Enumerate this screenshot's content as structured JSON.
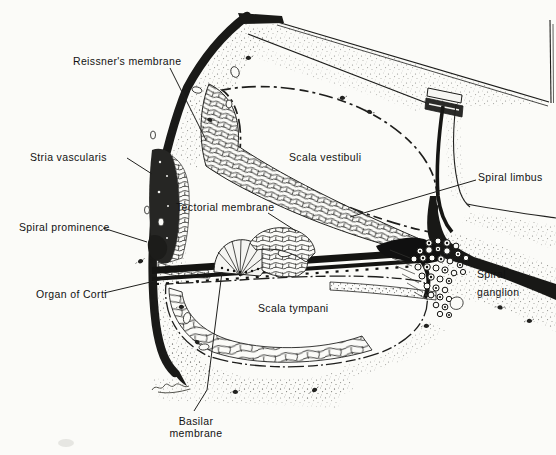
{
  "figure_type": "anatomical line illustration, cross-section of one cochlear turn",
  "colors": {
    "paper": "#fbfbf8",
    "ink": "#1c1c1c"
  },
  "labels": {
    "reissners_membrane": "Reissner's membrane",
    "stria_vascularis": "Stria vascularis",
    "spiral_prominence": "Spiral prominence",
    "organ_of_corti": "Organ of Corti",
    "tectorial_membrane": "Tectorial membrane",
    "scala_vestibuli": "Scala vestibuli",
    "scala_tympani": "Scala tympani",
    "spiral_limbus": "Spiral limbus",
    "spiral_ganglion_line1": "Spiral",
    "spiral_ganglion_line2": "ganglion",
    "basilar_membrane_line1": "Basilar",
    "basilar_membrane_line2": "membrane"
  }
}
